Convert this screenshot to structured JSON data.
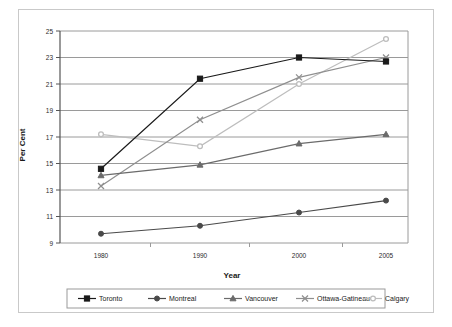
{
  "chart_data": {
    "type": "line",
    "title": "",
    "xlabel": "Year",
    "ylabel": "Per Cent",
    "x": [
      1980,
      1990,
      2000,
      2005
    ],
    "categories": [
      "1980",
      "1990",
      "2000",
      "2005"
    ],
    "xtick_labels": [
      "1980",
      "1990",
      "2000",
      "2005"
    ],
    "ytick_labels": [
      "9",
      "11",
      "13",
      "15",
      "17",
      "19",
      "21",
      "23",
      "25"
    ],
    "yticks": [
      9,
      11,
      13,
      15,
      17,
      19,
      21,
      23,
      25
    ],
    "ylim": [
      9,
      25
    ],
    "grid": "horizontal",
    "legend_position": "bottom",
    "series": [
      {
        "name": "Toronto",
        "values": [
          14.6,
          21.4,
          23.0,
          22.7
        ],
        "color": "#1a1a1a",
        "marker": "square"
      },
      {
        "name": "Montreal",
        "values": [
          9.7,
          10.3,
          11.3,
          12.2
        ],
        "color": "#4a4a4a",
        "marker": "circle"
      },
      {
        "name": "Vancouver",
        "values": [
          14.1,
          14.9,
          16.5,
          17.2
        ],
        "color": "#6b6b6b",
        "marker": "triangle"
      },
      {
        "name": "Ottawa-Gatineau",
        "values": [
          13.3,
          18.3,
          21.5,
          23.0
        ],
        "color": "#8f8f8f",
        "marker": "x"
      },
      {
        "name": "Calgary",
        "values": [
          17.2,
          16.3,
          21.0,
          24.4
        ],
        "color": "#bdbdbd",
        "marker": "circle-open"
      }
    ]
  },
  "legend": {
    "entries": [
      {
        "label": "Toronto"
      },
      {
        "label": "Montreal"
      },
      {
        "label": "Vancouver"
      },
      {
        "label": "Ottawa-Gatineau"
      },
      {
        "label": "Calgary"
      }
    ]
  },
  "colors": {
    "frame": "#c9c9c9",
    "gridline": "#9a9a9a",
    "axis": "#6f6f6f",
    "background": "#ffffff",
    "text": "#1a1a1a"
  }
}
